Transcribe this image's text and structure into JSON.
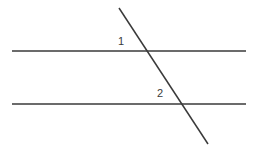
{
  "figure": {
    "kind": "geometry-diagram",
    "width": 256,
    "height": 152,
    "background_color": "#ffffff",
    "stroke_color": "#3a3a3a",
    "stroke_width": 1.5,
    "lines": [
      {
        "name": "upper-parallel-line",
        "role": "parallel",
        "x1": 12,
        "y1": 51,
        "x2": 246,
        "y2": 51
      },
      {
        "name": "lower-parallel-line",
        "role": "parallel",
        "x1": 12,
        "y1": 104,
        "x2": 246,
        "y2": 104
      },
      {
        "name": "transversal-line",
        "role": "transversal",
        "x1": 119,
        "y1": 8,
        "x2": 208,
        "y2": 144
      }
    ],
    "intersections": [
      {
        "name": "upper-intersection",
        "x": 145,
        "y": 51
      },
      {
        "name": "lower-intersection",
        "x": 181,
        "y": 104
      }
    ],
    "labels": [
      {
        "name": "angle-label-1",
        "text": "1",
        "x": 122,
        "y": 42,
        "anchor": "upper-intersection",
        "position": "above-left",
        "color": "#3a3a3a",
        "font_size": 11
      },
      {
        "name": "angle-label-2",
        "text": "2",
        "x": 161,
        "y": 94,
        "anchor": "lower-intersection",
        "position": "above-left",
        "color": "#3a3a3a",
        "font_size": 11
      }
    ]
  }
}
